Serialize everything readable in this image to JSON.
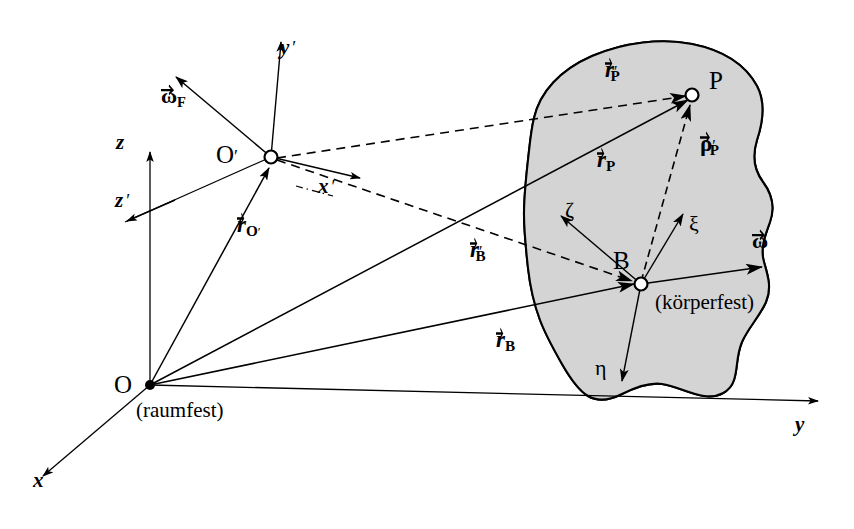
{
  "figure": {
    "type": "physics-reference-frame-diagram",
    "background_color": "#ffffff",
    "line_color": "#000000",
    "body_fill_color": "#d4d4d4",
    "body_outline_color": "#000000"
  },
  "frames": {
    "space_fixed": {
      "origin_label": "O",
      "caption": "(raumfest)",
      "axes": [
        {
          "name": "x-axis",
          "label": "x"
        },
        {
          "name": "y-axis",
          "label": "y"
        },
        {
          "name": "z-axis",
          "label": "z"
        }
      ]
    },
    "moving": {
      "origin_label": "O'",
      "axes": [
        {
          "name": "x-prime-axis",
          "label": "x",
          "prime": "′"
        },
        {
          "name": "y-prime-axis",
          "label": "y",
          "prime": "′"
        },
        {
          "name": "z-prime-axis",
          "label": "z",
          "prime": "′"
        }
      ],
      "angular_velocity": {
        "symbol": "ω",
        "subscript": "F"
      }
    },
    "body_fixed": {
      "origin_label": "B",
      "caption": "(körperfest)",
      "axes": [
        {
          "name": "xi-axis",
          "label": "ξ"
        },
        {
          "name": "eta-axis",
          "label": "η"
        },
        {
          "name": "zeta-axis",
          "label": "ζ"
        }
      ],
      "angular_velocity": {
        "symbol": "ω",
        "subscript": ""
      }
    }
  },
  "points": [
    {
      "name": "point-O",
      "label": "O"
    },
    {
      "name": "point-O-prime",
      "label": "O′"
    },
    {
      "name": "point-B",
      "label": "B"
    },
    {
      "name": "point-P",
      "label": "P"
    }
  ],
  "vectors": [
    {
      "name": "vector-r-O-prime",
      "symbol": "r",
      "subscript": "O′",
      "prime": "",
      "style": "solid",
      "from": "O",
      "to": "O′"
    },
    {
      "name": "vector-r-B",
      "symbol": "r",
      "subscript": "B",
      "prime": "",
      "style": "solid",
      "from": "O",
      "to": "B"
    },
    {
      "name": "vector-r-P",
      "symbol": "r",
      "subscript": "P",
      "prime": "",
      "style": "solid",
      "from": "O",
      "to": "P"
    },
    {
      "name": "vector-r-B-prime",
      "symbol": "r",
      "subscript": "B",
      "prime": "′",
      "style": "dashed",
      "from": "O′",
      "to": "B"
    },
    {
      "name": "vector-r-P-prime",
      "symbol": "r",
      "subscript": "P",
      "prime": "′",
      "style": "dashed",
      "from": "O′",
      "to": "P"
    },
    {
      "name": "vector-rho-P-prime",
      "symbol": "ρ",
      "subscript": "P",
      "prime": "′",
      "style": "dashed",
      "from": "B",
      "to": "P"
    }
  ],
  "labels": {
    "x": "x",
    "y": "y",
    "z": "z",
    "x_prime": "x",
    "y_prime": "y",
    "z_prime": "z",
    "prime_mark": "′",
    "O": "O",
    "O_prime": "O",
    "B": "B",
    "P": "P",
    "xi": "ξ",
    "eta": "η",
    "zeta": "ζ",
    "omega": "ω",
    "omega_F_sub": "F",
    "rho": "ρ",
    "r": "r",
    "sub_O_prime": "O",
    "sub_B": "B",
    "sub_P": "P",
    "raumfest": "(raumfest)",
    "koerperfest": "(körperfest)"
  }
}
